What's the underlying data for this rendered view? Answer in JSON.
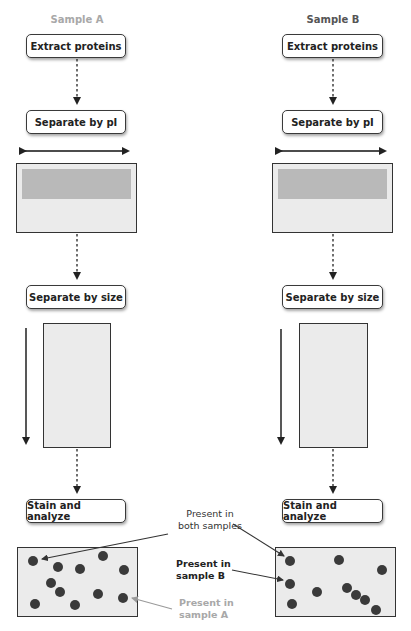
{
  "columns": {
    "a": {
      "title": "Sample A",
      "title_color": "#a8a8a8",
      "steps": {
        "extract": "Extract proteins",
        "pi": "Separate by pI",
        "size": "Separate by size",
        "stain": "Stain and analyze"
      }
    },
    "b": {
      "title": "Sample B",
      "title_color": "#555555",
      "steps": {
        "extract": "Extract proteins",
        "pi": "Separate by pI",
        "size": "Separate by size",
        "stain": "Stain and analyze"
      }
    }
  },
  "annotations": {
    "both": {
      "line1": "Present in",
      "line2": "both samples",
      "color": "#333333"
    },
    "sample_b": {
      "line1": "Present in",
      "line2": "sample B",
      "color": "#222222"
    },
    "sample_a": {
      "line1": "Present in",
      "line2": "sample A",
      "color": "#a8a8a8"
    }
  },
  "colors": {
    "gel_fill": "#ebebeb",
    "band_fill": "#b9b9b9",
    "spot_fill": "#3a3a3a",
    "line": "#222222"
  },
  "spots": {
    "a": [
      [
        33,
        562
      ],
      [
        57,
        556
      ],
      [
        80,
        566
      ],
      [
        102,
        556
      ],
      [
        124,
        568
      ],
      [
        50,
        582
      ],
      [
        60,
        594
      ],
      [
        36,
        601
      ],
      [
        98,
        595
      ],
      [
        122,
        598
      ],
      [
        75,
        605
      ]
    ],
    "b": [
      [
        290,
        562
      ],
      [
        339,
        560
      ],
      [
        380,
        570
      ],
      [
        290,
        581
      ],
      [
        315,
        593
      ],
      [
        346,
        589
      ],
      [
        356,
        595
      ],
      [
        366,
        600
      ],
      [
        292,
        605
      ],
      [
        376,
        610
      ]
    ]
  }
}
